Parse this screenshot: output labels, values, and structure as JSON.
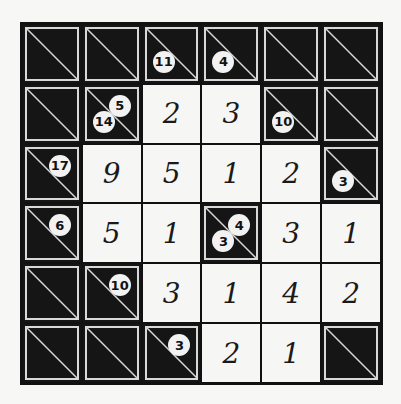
{
  "puzzle": {
    "type": "kakuro",
    "rows": 6,
    "cols": 6,
    "grid": [
      [
        {
          "t": "b"
        },
        {
          "t": "b"
        },
        {
          "t": "b",
          "down": "11"
        },
        {
          "t": "b",
          "down": "4"
        },
        {
          "t": "b"
        },
        {
          "t": "b"
        }
      ],
      [
        {
          "t": "b"
        },
        {
          "t": "b",
          "down": "14",
          "across": "5"
        },
        {
          "t": "w",
          "v": "2"
        },
        {
          "t": "w",
          "v": "3"
        },
        {
          "t": "b",
          "down": "10"
        },
        {
          "t": "b"
        }
      ],
      [
        {
          "t": "b",
          "across": "17"
        },
        {
          "t": "w",
          "v": "9"
        },
        {
          "t": "w",
          "v": "5"
        },
        {
          "t": "w",
          "v": "1"
        },
        {
          "t": "w",
          "v": "2"
        },
        {
          "t": "b",
          "down": "3"
        }
      ],
      [
        {
          "t": "b",
          "across": "6"
        },
        {
          "t": "w",
          "v": "5"
        },
        {
          "t": "w",
          "v": "1"
        },
        {
          "t": "b",
          "down": "3",
          "across": "4"
        },
        {
          "t": "w",
          "v": "3"
        },
        {
          "t": "w",
          "v": "1"
        }
      ],
      [
        {
          "t": "b"
        },
        {
          "t": "b",
          "across": "10"
        },
        {
          "t": "w",
          "v": "3"
        },
        {
          "t": "w",
          "v": "1"
        },
        {
          "t": "w",
          "v": "4"
        },
        {
          "t": "w",
          "v": "2"
        }
      ],
      [
        {
          "t": "b"
        },
        {
          "t": "b"
        },
        {
          "t": "b",
          "across": "3"
        },
        {
          "t": "w",
          "v": "2"
        },
        {
          "t": "w",
          "v": "1"
        },
        {
          "t": "b"
        }
      ]
    ]
  },
  "colors": {
    "block": "#151515",
    "cell": "#f6f6f4",
    "clue_bubble": "#f2f2f2",
    "diagonal": "#d8d8d8"
  }
}
